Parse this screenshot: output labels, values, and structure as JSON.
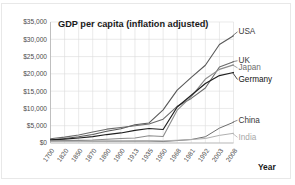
{
  "chart_data": {
    "type": "line",
    "title": "GDP per capita (inflation adjusted)",
    "xlabel": "Year",
    "ylabel": "",
    "grid": true,
    "legend_position": "right-of-plot-inline",
    "xlim": [
      0,
      13
    ],
    "ylim": [
      0,
      35000
    ],
    "ytick_labels": [
      "$0",
      "$5,000",
      "$10,000",
      "$15,000",
      "$20,000",
      "$25,000",
      "$30,000",
      "$35,000"
    ],
    "ytick_values": [
      0,
      5000,
      10000,
      15000,
      20000,
      25000,
      30000,
      35000
    ],
    "categories": [
      "1700",
      "1820",
      "1850",
      "1870",
      "1890",
      "1900",
      "1913",
      "1935",
      "1950",
      "1968",
      "1981",
      "1992",
      "2003",
      "2008"
    ],
    "series": [
      {
        "name": "USA",
        "color": "#595959",
        "width": 1.1,
        "values": [
          800,
          1300,
          1800,
          2450,
          3400,
          4100,
          5300,
          5800,
          9600,
          15300,
          19000,
          22500,
          28500,
          31000
        ]
      },
      {
        "name": "UK",
        "color": "#6b6b6b",
        "width": 1.1,
        "values": [
          1250,
          1700,
          2300,
          3200,
          4000,
          4500,
          5000,
          5500,
          6900,
          10600,
          12900,
          15900,
          22000,
          23500
        ]
      },
      {
        "name": "Japan",
        "color": "#8c8c8c",
        "width": 1.1,
        "values": [
          600,
          700,
          750,
          850,
          1100,
          1300,
          1450,
          2100,
          1900,
          9500,
          13400,
          18500,
          21300,
          22600
        ]
      },
      {
        "name": "Germany",
        "color": "#1f1f1f",
        "width": 1.2,
        "values": [
          900,
          1100,
          1450,
          1850,
          2450,
          2900,
          3650,
          4200,
          3900,
          10400,
          13800,
          17200,
          19500,
          20400
        ]
      },
      {
        "name": "China",
        "color": "#6e6e6e",
        "width": 1.0,
        "values": [
          600,
          600,
          600,
          530,
          540,
          545,
          550,
          560,
          450,
          700,
          1000,
          1800,
          4300,
          6000
        ]
      },
      {
        "name": "India",
        "color": "#b0b0b0",
        "width": 1.0,
        "values": [
          550,
          530,
          520,
          530,
          580,
          600,
          670,
          700,
          620,
          800,
          1000,
          1300,
          2200,
          2800
        ]
      }
    ],
    "series_labels": [
      {
        "name": "USA",
        "text": "USA",
        "color": "#3a3a3a",
        "weight": "normal"
      },
      {
        "name": "UK",
        "text": "UK",
        "color": "#3a3a3a",
        "weight": "normal"
      },
      {
        "name": "Japan",
        "text": "Japan",
        "color": "#6d6d6d",
        "weight": "normal"
      },
      {
        "name": "Germany",
        "text": "Germany",
        "color": "#141414",
        "weight": "normal"
      },
      {
        "name": "China",
        "text": "China",
        "color": "#3a3a3a",
        "weight": "normal"
      },
      {
        "name": "India",
        "text": "India",
        "color": "#a8a8a8",
        "weight": "normal"
      }
    ]
  }
}
